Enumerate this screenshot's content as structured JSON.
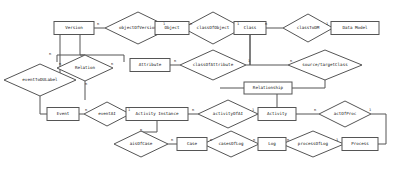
{
  "diagram": {
    "kind": "er-diagram",
    "width": 394,
    "height": 174,
    "colors": {
      "background": "#ffffff",
      "stroke": "#555555",
      "text": "#111111",
      "fill": "#ffffff"
    },
    "entities": [
      {
        "id": "version",
        "label": "Version",
        "x": 74,
        "y": 28,
        "w": 40,
        "h": 13
      },
      {
        "id": "object",
        "label": "Object",
        "x": 172,
        "y": 28,
        "w": 34,
        "h": 13
      },
      {
        "id": "class",
        "label": "Class",
        "x": 250,
        "y": 28,
        "w": 32,
        "h": 13
      },
      {
        "id": "datamodel",
        "label": "Data Model",
        "x": 355,
        "y": 28,
        "w": 48,
        "h": 13
      },
      {
        "id": "attribute",
        "label": "Attribute",
        "x": 150,
        "y": 65,
        "w": 40,
        "h": 13
      },
      {
        "id": "relationship",
        "label": "Relationship",
        "x": 268,
        "y": 88,
        "w": 48,
        "h": 12
      },
      {
        "id": "event",
        "label": "Event",
        "x": 63,
        "y": 114,
        "w": 32,
        "h": 13
      },
      {
        "id": "activityinst",
        "label": "Activity Instance",
        "x": 157,
        "y": 114,
        "w": 62,
        "h": 13
      },
      {
        "id": "activity",
        "label": "Activity",
        "x": 277,
        "y": 114,
        "w": 38,
        "h": 13
      },
      {
        "id": "case",
        "label": "Case",
        "x": 192,
        "y": 144,
        "w": 30,
        "h": 13
      },
      {
        "id": "log",
        "label": "Log",
        "x": 272,
        "y": 144,
        "w": 28,
        "h": 13
      },
      {
        "id": "process",
        "label": "Process",
        "x": 360,
        "y": 144,
        "w": 36,
        "h": 13
      }
    ],
    "relationships": [
      {
        "id": "objectOfVersion",
        "label": "objectOfVersion",
        "x": 138,
        "y": 28,
        "rx": 33,
        "ry": 16
      },
      {
        "id": "classOfObject",
        "label": "classOfObject",
        "x": 213,
        "y": 28,
        "rx": 30,
        "ry": 16
      },
      {
        "id": "classToDM",
        "label": "classToDM",
        "x": 308,
        "y": 28,
        "rx": 25,
        "ry": 14
      },
      {
        "id": "classOfAttribute",
        "label": "classOfAttribute",
        "x": 213,
        "y": 65,
        "rx": 33,
        "ry": 15
      },
      {
        "id": "sourcetargetClass",
        "label": "source/targetClass",
        "x": 325,
        "y": 65,
        "rx": 37,
        "ry": 15
      },
      {
        "id": "Relation",
        "label": "Relation",
        "x": 85,
        "y": 68,
        "rx": 28,
        "ry": 13
      },
      {
        "id": "eventToDULabel",
        "label": "eventToDULabel",
        "x": 40,
        "y": 80,
        "rx": 36,
        "ry": 16
      },
      {
        "id": "eventAI",
        "label": "eventAI",
        "x": 107,
        "y": 114,
        "rx": 23,
        "ry": 12
      },
      {
        "id": "activityOfAI",
        "label": "activityOfAI",
        "x": 228,
        "y": 114,
        "rx": 30,
        "ry": 14
      },
      {
        "id": "actOfProc",
        "label": "actOfProc",
        "x": 345,
        "y": 114,
        "rx": 26,
        "ry": 13
      },
      {
        "id": "aisOfCase",
        "label": "aisOfCase",
        "x": 141,
        "y": 144,
        "rx": 27,
        "ry": 13
      },
      {
        "id": "casesOfLog",
        "label": "casesOfLog",
        "x": 231,
        "y": 144,
        "rx": 28,
        "ry": 13
      },
      {
        "id": "processOfLog",
        "label": "processOfLog",
        "x": 313,
        "y": 144,
        "rx": 31,
        "ry": 13
      }
    ],
    "cardinalities": [
      {
        "id": "c1",
        "text": "n",
        "x": 98,
        "y": 24
      },
      {
        "id": "c2",
        "text": "1",
        "x": 164,
        "y": 24
      },
      {
        "id": "c3",
        "text": "n",
        "x": 191,
        "y": 24
      },
      {
        "id": "c4",
        "text": "1",
        "x": 238,
        "y": 24
      },
      {
        "id": "c5",
        "text": "n",
        "x": 266,
        "y": 24
      },
      {
        "id": "c6",
        "text": "1",
        "x": 327,
        "y": 24
      },
      {
        "id": "c7",
        "text": "n",
        "x": 175,
        "y": 61
      },
      {
        "id": "c8",
        "text": "1",
        "x": 249,
        "y": 61
      },
      {
        "id": "c9",
        "text": "n",
        "x": 291,
        "y": 61
      },
      {
        "id": "c10",
        "text": "n",
        "x": 60,
        "y": 64
      },
      {
        "id": "c11",
        "text": "n",
        "x": 112,
        "y": 64
      },
      {
        "id": "c12",
        "text": "n",
        "x": 50,
        "y": 54
      },
      {
        "id": "c13",
        "text": "n",
        "x": 86,
        "y": 84
      },
      {
        "id": "c14",
        "text": "n",
        "x": 86,
        "y": 110
      },
      {
        "id": "c15",
        "text": "1",
        "x": 129,
        "y": 110
      },
      {
        "id": "c16",
        "text": "n",
        "x": 193,
        "y": 110
      },
      {
        "id": "c17",
        "text": "1",
        "x": 253,
        "y": 110
      },
      {
        "id": "c18",
        "text": "n",
        "x": 315,
        "y": 110
      },
      {
        "id": "c19",
        "text": "1",
        "x": 370,
        "y": 110
      },
      {
        "id": "c20",
        "text": "n",
        "x": 141,
        "y": 130
      },
      {
        "id": "c21",
        "text": "n",
        "x": 172,
        "y": 140
      },
      {
        "id": "c22",
        "text": "n",
        "x": 211,
        "y": 140
      },
      {
        "id": "c23",
        "text": "n",
        "x": 254,
        "y": 140
      },
      {
        "id": "c24",
        "text": "n",
        "x": 288,
        "y": 140
      },
      {
        "id": "c25",
        "text": "1",
        "x": 337,
        "y": 140
      }
    ],
    "edges": [
      {
        "id": "e-version-objectOfVersion",
        "d": "M 94,28 L 105,28"
      },
      {
        "id": "e-objectOfVersion-object",
        "d": "M 171,28 L 155,28"
      },
      {
        "id": "e-object-classOfObject",
        "d": "M 189,28 L 183,28"
      },
      {
        "id": "e-classOfObject-class",
        "d": "M 243,28 L 234,28"
      },
      {
        "id": "e-class-classToDM",
        "d": "M 266,28 L 283,28"
      },
      {
        "id": "e-classToDM-datamodel",
        "d": "M 333,28 L 331,28"
      },
      {
        "id": "e-attribute-classOfAttr",
        "d": "M 170,65 L 180,65"
      },
      {
        "id": "e-classOfAttr-class",
        "d": "M 246,65 L 250,65 L 250,35"
      },
      {
        "id": "e-class-srctgt",
        "d": "M 250,35 L 250,65 L 288,65"
      },
      {
        "id": "e-version-down",
        "d": "M 60,35 L 60,80 L 40,80"
      },
      {
        "id": "e-version-relation",
        "d": "M 80,35 L 80,55 L 85,55"
      },
      {
        "id": "e-relation-box",
        "d": "M 57,55 L 124,55 L 124,62"
      },
      {
        "id": "e-relation-top",
        "d": "M 57,55 L 57,62"
      },
      {
        "id": "e-relation-down",
        "d": "M 85,81 L 85,100"
      },
      {
        "id": "e-eventToDU-event",
        "d": "M 40,96 L 40,114 L 47,114"
      },
      {
        "id": "e-event-eventAI",
        "d": "M 79,114 L 84,114"
      },
      {
        "id": "e-eventAI-ai",
        "d": "M 130,114 L 126,114"
      },
      {
        "id": "e-ai-activityOfAI",
        "d": "M 188,114 L 198,114"
      },
      {
        "id": "e-activityOfAI-activity",
        "d": "M 258,114 L 258,114"
      },
      {
        "id": "e-activity-actOfProc",
        "d": "M 296,114 L 319,114"
      },
      {
        "id": "e-actOfProc-process",
        "d": "M 371,114 L 386,114 L 386,144 L 378,144"
      },
      {
        "id": "e-ai-down",
        "d": "M 157,121 L 157,132 L 141,132 L 141,131"
      },
      {
        "id": "e-aisOfCase-case",
        "d": "M 168,144 L 177,144"
      },
      {
        "id": "e-case-casesOfLog",
        "d": "M 207,144 L 203,144"
      },
      {
        "id": "e-casesOfLog-log",
        "d": "M 259,144 L 258,144"
      },
      {
        "id": "e-log-processOfLog",
        "d": "M 286,144 L 282,144"
      },
      {
        "id": "e-processOfLog-process",
        "d": "M 344,144 L 342,144"
      },
      {
        "id": "e-activity-relationship",
        "d": "M 277,107 L 277,94"
      },
      {
        "id": "e-relationship-right",
        "d": "M 292,88 L 325,88 L 325,80"
      },
      {
        "id": "e-relationship-left",
        "d": "M 244,88 L 220,88"
      }
    ]
  }
}
